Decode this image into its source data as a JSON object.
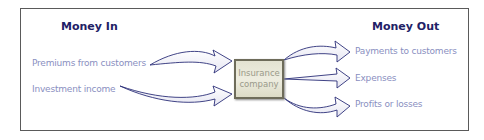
{
  "diagram": {
    "money_in": {
      "heading": "Money In",
      "items": [
        "Premiums from customers",
        "Investment income"
      ]
    },
    "center": {
      "line1": "Insurance",
      "line2": "company"
    },
    "money_out": {
      "heading": "Money Out",
      "items": [
        "Payments to customers",
        "Expenses",
        "Profits or losses"
      ]
    },
    "colors": {
      "heading": "#1f2266",
      "label": "#8a8fbf",
      "arrow_stroke": "#2b2f78",
      "box_fill": "#e8e7d8",
      "box_border": "#6e6c5a",
      "frame": "#5a5a5a"
    }
  }
}
